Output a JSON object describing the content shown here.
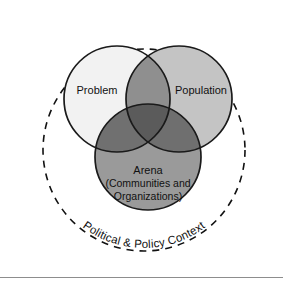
{
  "figure": {
    "background_color": "#ffffff"
  },
  "outer_context": {
    "label": "Political & Policy Context",
    "style": "dashed-circle",
    "stroke_color": "#111111"
  },
  "circles": [
    {
      "id": "problem",
      "label": "Problem",
      "fill_color": "#f2f2f2",
      "stroke_color": "#1a1a1a",
      "position": "top-left"
    },
    {
      "id": "population",
      "label": "Population",
      "fill_color": "#c4c4c4",
      "stroke_color": "#1a1a1a",
      "position": "top-right"
    },
    {
      "id": "arena",
      "label_line1": "Arena",
      "label_line2": "(Communities and",
      "label_line3": "Organizations)",
      "fill_color": "#9a9a9a",
      "stroke_color": "#1a1a1a",
      "position": "bottom-center"
    }
  ],
  "overlaps": {
    "problem_population": "#8f8f8f",
    "problem_arena": "#707070",
    "population_arena": "#6f6f6f",
    "all_three": "#5b5b5b"
  },
  "footer_rule": {
    "color": "#8d8d8d"
  }
}
